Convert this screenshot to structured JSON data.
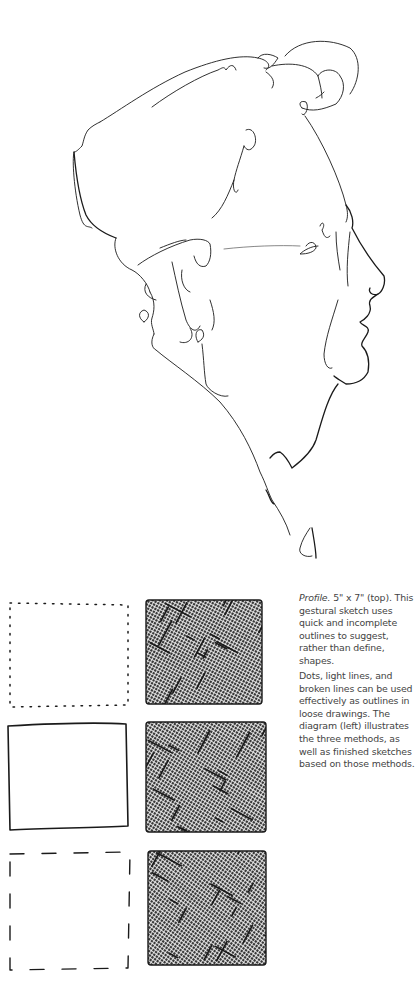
{
  "illustration": {
    "title": "Profile",
    "subject": "gestural-profile-sketch"
  },
  "diagram": {
    "rows": [
      {
        "method": "dots",
        "outline": "dotted-outline",
        "finished": "crosshatched-sketch"
      },
      {
        "method": "light lines",
        "outline": "solid-outline",
        "finished": "crosshatched-sketch"
      },
      {
        "method": "broken lines",
        "outline": "dashed-outline",
        "finished": "crosshatched-sketch"
      }
    ]
  },
  "captions": {
    "first_title": "Profile.",
    "first_body": " 5\" x 7\" (top). This gestural sketch uses quick and incomplete outlines to suggest, rather than define, shapes.",
    "second_body": "Dots, light lines, and broken lines can be used effectively as outlines in loose drawings. The diagram (left) illustrates the three methods, as well as finished sketches based on those methods."
  },
  "colors": {
    "ink": "#1a1a1a",
    "caption_text": "#444444",
    "background": "#ffffff"
  }
}
